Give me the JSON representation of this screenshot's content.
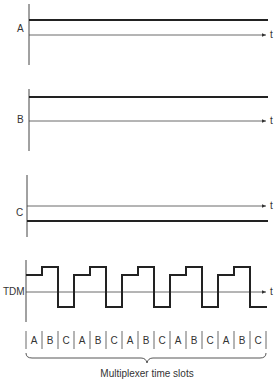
{
  "diagram": {
    "type": "time-division-multiplexing",
    "time_axis_label": "t",
    "signals": [
      {
        "name": "A",
        "level": "high"
      },
      {
        "name": "B",
        "level": "high"
      },
      {
        "name": "C",
        "level": "low"
      }
    ],
    "tdm": {
      "label": "TDM",
      "slot_sequence": [
        "A",
        "B",
        "C",
        "A",
        "B",
        "C",
        "A",
        "B",
        "C",
        "A",
        "B",
        "C",
        "A",
        "B",
        "C"
      ]
    },
    "caption": "Multiplexer time slots"
  }
}
